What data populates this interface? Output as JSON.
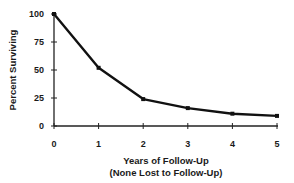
{
  "chart_data": {
    "type": "line",
    "title": "",
    "xlabel": "Years of Follow-Up",
    "xlabel_sub": "(None Lost to Follow-Up)",
    "ylabel": "Percent Surviving",
    "x": [
      0,
      1,
      2,
      3,
      4,
      5
    ],
    "series": [
      {
        "name": "Percent Surviving",
        "values": [
          100,
          52,
          24,
          16,
          11,
          9
        ]
      }
    ],
    "xticks": [
      "0",
      "1",
      "2",
      "3",
      "4",
      "5"
    ],
    "yticks": [
      "0",
      "25",
      "50",
      "75",
      "100"
    ],
    "xlim": [
      0,
      5
    ],
    "ylim": [
      0,
      100
    ],
    "grid": false,
    "legend": null,
    "line_color": "#111111"
  },
  "labels": {
    "ylabel": "Percent Surviving",
    "xlabel": "Years of Follow-Up",
    "xlabel_sub": "(None Lost to Follow-Up)",
    "yticks": [
      "0",
      "25",
      "50",
      "75",
      "100"
    ],
    "xticks": [
      "0",
      "1",
      "2",
      "3",
      "4",
      "5"
    ]
  }
}
